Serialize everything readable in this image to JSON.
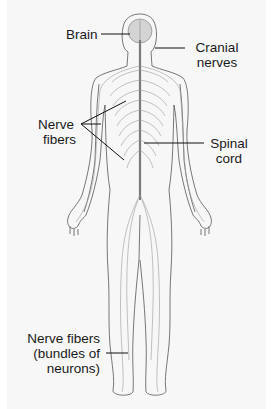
{
  "diagram": {
    "labels": {
      "brain": "Brain",
      "cranial_nerves_line1": "Cranial",
      "cranial_nerves_line2": "nerves",
      "nerve_fibers_line1": "Nerve",
      "nerve_fibers_line2": "fibers",
      "spinal_cord_line1": "Spinal",
      "spinal_cord_line2": "cord",
      "bundles_line1": "Nerve fibers",
      "bundles_line2": "(bundles of",
      "bundles_line3": "neurons)"
    },
    "colors": {
      "background": "#f7f7f7",
      "outline": "#555555",
      "nerve": "#8a8a8a",
      "brain_fill": "#d4d4d4",
      "leader_line": "#111111"
    }
  }
}
